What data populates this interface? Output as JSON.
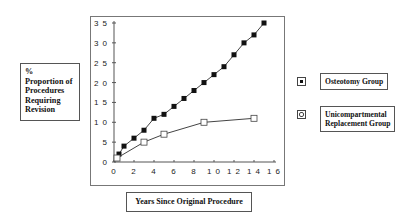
{
  "chart_data": {
    "type": "line",
    "title": "",
    "xlabel": "Years Since Original Procedure",
    "ylabel": [
      "%",
      "Proportion of",
      "Procedures",
      "Requiring",
      "Revision"
    ],
    "xlim": [
      0,
      16
    ],
    "ylim": [
      0,
      35
    ],
    "xticks": [
      0,
      2,
      4,
      6,
      8,
      10,
      12,
      14,
      16
    ],
    "yticks": [
      0,
      5,
      10,
      15,
      20,
      25,
      30,
      35
    ],
    "xtick_labels": [
      "0",
      "2",
      "4",
      "6",
      "8",
      "1 0",
      "1 2",
      "1 4",
      "1 6"
    ],
    "ytick_labels": [
      "0",
      "5",
      "1 0",
      "1 5",
      "2 0",
      "2 5",
      "3 0",
      "3 5"
    ],
    "grid": false,
    "legend_position": "right",
    "series": [
      {
        "name": "Osteotomy Group",
        "marker": "filled-square",
        "x": [
          0.5,
          1,
          2,
          3,
          4,
          5,
          6,
          7,
          8,
          9,
          10,
          11,
          12,
          13,
          14,
          15
        ],
        "values": [
          2,
          4,
          6,
          8,
          11,
          12,
          14,
          16,
          18,
          20,
          22,
          24,
          27,
          30,
          32,
          35
        ]
      },
      {
        "name": "Unicompartmental Replacement Group",
        "marker": "open-square",
        "x": [
          0.3,
          3,
          5,
          9,
          14
        ],
        "values": [
          1,
          5,
          7,
          10,
          11
        ]
      }
    ]
  },
  "legend": {
    "items": [
      {
        "label_lines": [
          "Osteotomy Group"
        ]
      },
      {
        "label_lines": [
          "Unicompartmental",
          "Replacement Group"
        ]
      }
    ]
  },
  "colors": {
    "line": "#444444",
    "marker_fill": "#111111",
    "frame": "#777777"
  }
}
